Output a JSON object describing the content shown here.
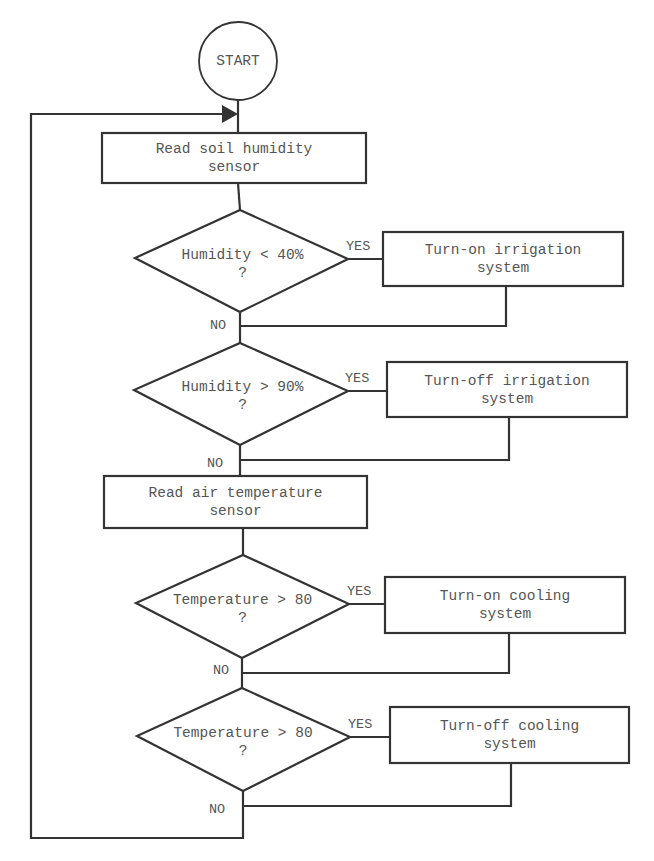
{
  "flowchart": {
    "start": {
      "label": "START"
    },
    "read_soil": {
      "line1": "Read soil humidity",
      "line2": "sensor"
    },
    "decision_humidity_low": {
      "line1": "Humidity < 40%",
      "line2": "?"
    },
    "action_irrigation_on": {
      "line1": "Turn-on irrigation",
      "line2": "system"
    },
    "decision_humidity_high": {
      "line1": "Humidity > 90%",
      "line2": "?"
    },
    "action_irrigation_off": {
      "line1": "Turn-off irrigation",
      "line2": "system"
    },
    "read_air": {
      "line1": "Read air temperature",
      "line2": "sensor"
    },
    "decision_temp_high_1": {
      "line1": "Temperature > 80",
      "line2": "?"
    },
    "action_cooling_on": {
      "line1": "Turn-on cooling",
      "line2": "system"
    },
    "decision_temp_high_2": {
      "line1": "Temperature > 80",
      "line2": "?"
    },
    "action_cooling_off": {
      "line1": "Turn-off cooling",
      "line2": "system"
    },
    "labels": {
      "yes": "YES",
      "no": "NO"
    }
  },
  "colors": {
    "stroke": "#333333",
    "text": "#555555",
    "background": "#ffffff"
  }
}
